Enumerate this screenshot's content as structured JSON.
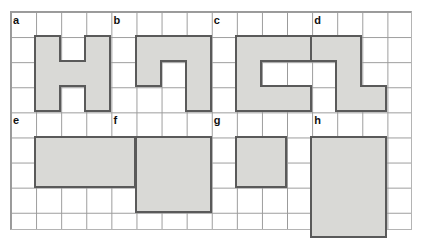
{
  "worksheet": {
    "title": "Shapes on grid worksheet",
    "grid": {
      "columns": 16,
      "rows": 9,
      "cell_size_px": 25.1,
      "origin_x_px": 10,
      "origin_y_px": 11,
      "line_color": "#9a9a9a",
      "background": "#ffffff"
    },
    "shape_style": {
      "fill": "#d9d9d6",
      "stroke": "#5a5a5a",
      "stroke_width_px": 2
    },
    "shapes": [
      {
        "label": "a",
        "name": "h-shape",
        "label_col": 0,
        "label_row": 0,
        "origin_col": 1,
        "origin_row": 1,
        "width_cells": 3,
        "height_cells": 3,
        "cells": [
          [
            0,
            0
          ],
          [
            2,
            0
          ],
          [
            0,
            1
          ],
          [
            1,
            1
          ],
          [
            2,
            1
          ],
          [
            0,
            2
          ],
          [
            2,
            2
          ]
        ],
        "area_cells": 7
      },
      {
        "label": "b",
        "name": "reverse-z-shape",
        "label_col": 4,
        "label_row": 0,
        "origin_col": 5,
        "origin_row": 1,
        "width_cells": 3,
        "height_cells": 3,
        "cells": [
          [
            0,
            0
          ],
          [
            1,
            0
          ],
          [
            2,
            0
          ],
          [
            0,
            1
          ],
          [
            2,
            1
          ],
          [
            2,
            2
          ]
        ],
        "area_cells": 6
      },
      {
        "label": "c",
        "name": "c-shape",
        "label_col": 8,
        "label_row": 0,
        "origin_col": 9,
        "origin_row": 1,
        "width_cells": 3,
        "height_cells": 3,
        "cells": [
          [
            0,
            0
          ],
          [
            1,
            0
          ],
          [
            2,
            0
          ],
          [
            0,
            1
          ],
          [
            0,
            2
          ],
          [
            1,
            2
          ],
          [
            2,
            2
          ]
        ],
        "area_cells": 7
      },
      {
        "label": "d",
        "name": "z-shape",
        "label_col": 12,
        "label_row": 0,
        "origin_col": 12,
        "origin_row": 1,
        "width_cells": 3,
        "height_cells": 3,
        "cells": [
          [
            0,
            0
          ],
          [
            1,
            0
          ],
          [
            1,
            1
          ],
          [
            1,
            2
          ],
          [
            2,
            2
          ]
        ],
        "area_cells": 5
      },
      {
        "label": "e",
        "name": "rectangle-4x2",
        "label_col": 0,
        "label_row": 4,
        "origin_col": 1,
        "origin_row": 5,
        "width_cells": 4,
        "height_cells": 2,
        "cells": [
          [
            0,
            0
          ],
          [
            1,
            0
          ],
          [
            2,
            0
          ],
          [
            3,
            0
          ],
          [
            0,
            1
          ],
          [
            1,
            1
          ],
          [
            2,
            1
          ],
          [
            3,
            1
          ]
        ],
        "area_cells": 8
      },
      {
        "label": "f",
        "name": "square-3x3",
        "label_col": 4,
        "label_row": 4,
        "origin_col": 5,
        "origin_row": 5,
        "width_cells": 3,
        "height_cells": 3,
        "cells": [
          [
            0,
            0
          ],
          [
            1,
            0
          ],
          [
            2,
            0
          ],
          [
            0,
            1
          ],
          [
            1,
            1
          ],
          [
            2,
            1
          ],
          [
            0,
            2
          ],
          [
            1,
            2
          ],
          [
            2,
            2
          ]
        ],
        "area_cells": 9
      },
      {
        "label": "g",
        "name": "square-2x2",
        "label_col": 8,
        "label_row": 4,
        "origin_col": 9,
        "origin_row": 5,
        "width_cells": 2,
        "height_cells": 2,
        "cells": [
          [
            0,
            0
          ],
          [
            1,
            0
          ],
          [
            0,
            1
          ],
          [
            1,
            1
          ]
        ],
        "area_cells": 4
      },
      {
        "label": "h",
        "name": "rectangle-3x4",
        "label_col": 12,
        "label_row": 4,
        "origin_col": 12,
        "origin_row": 5,
        "width_cells": 3,
        "height_cells": 4,
        "cells": [
          [
            0,
            0
          ],
          [
            1,
            0
          ],
          [
            2,
            0
          ],
          [
            0,
            1
          ],
          [
            1,
            1
          ],
          [
            2,
            1
          ],
          [
            0,
            2
          ],
          [
            1,
            2
          ],
          [
            2,
            2
          ],
          [
            0,
            3
          ],
          [
            1,
            3
          ],
          [
            2,
            3
          ]
        ],
        "area_cells": 12
      }
    ]
  }
}
